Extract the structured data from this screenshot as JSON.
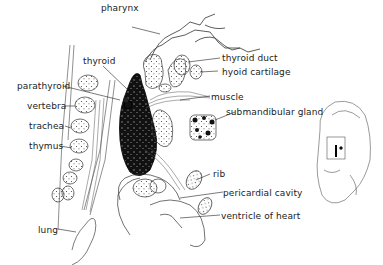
{
  "diagram": {
    "type": "anatomical illustration",
    "labels": {
      "pharynx": "pharynx",
      "thyroid": "thyroid",
      "thyroid_duct": "thyroid duct",
      "hyoid_cartilage": "hyoid cartilage",
      "parathyroid": "parathyroid",
      "vertebra": "vertebra",
      "trachea": "trachea",
      "thymus": "thymus",
      "muscle": "muscle",
      "submandibular_gland": "submandibular gland",
      "rib": "rib",
      "pericardial_cavity": "pericardial cavity",
      "ventricle_of_heart": "ventricle of heart",
      "lung": "lung"
    },
    "inset": "whole embryo outline with boxed region indicating section area"
  }
}
